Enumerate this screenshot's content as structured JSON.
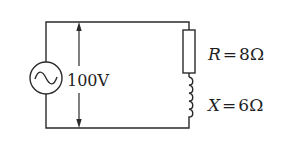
{
  "diagram": {
    "type": "ac-series-rl-circuit",
    "source": {
      "symbol": "ac-voltage-source",
      "voltage_label": "100V"
    },
    "components": [
      {
        "id": "resistor",
        "symbol": "R",
        "equals": "=",
        "value": "8Ω"
      },
      {
        "id": "inductor",
        "symbol": "X",
        "equals": "=",
        "value": "6Ω"
      }
    ]
  }
}
